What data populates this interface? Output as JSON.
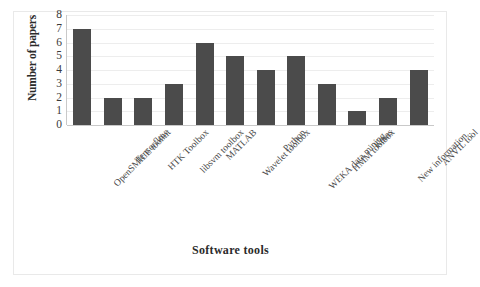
{
  "chart_data": {
    "type": "bar",
    "title": "",
    "xlabel": "Software tools",
    "ylabel": "Number of papers",
    "categories": [
      "OpenSMILE toolkit",
      "Tensorflow",
      "HTK Toolbox",
      "libsvm toolbox",
      "MATLAB",
      "Wavelet toolbox",
      "Python",
      "WEKA data mining..",
      "HMM toolbox",
      "Keras",
      "New information..",
      "ANVIL tool"
    ],
    "values": [
      7,
      2,
      2,
      3,
      6,
      5,
      4,
      5,
      3,
      1,
      2,
      4
    ],
    "ylim": [
      0,
      8
    ],
    "yticks": [
      0,
      1,
      2,
      3,
      4,
      5,
      6,
      7,
      8
    ],
    "ytick_labels": [
      "0",
      "1",
      "2",
      "3",
      "4",
      "5",
      "6",
      "7",
      "8"
    ],
    "grid": true,
    "legend": false,
    "bar_color": "#4b4b4b",
    "gridline_color": "#ededed",
    "axis_color": "#c9c9c9",
    "xtick_rotation": -45
  }
}
